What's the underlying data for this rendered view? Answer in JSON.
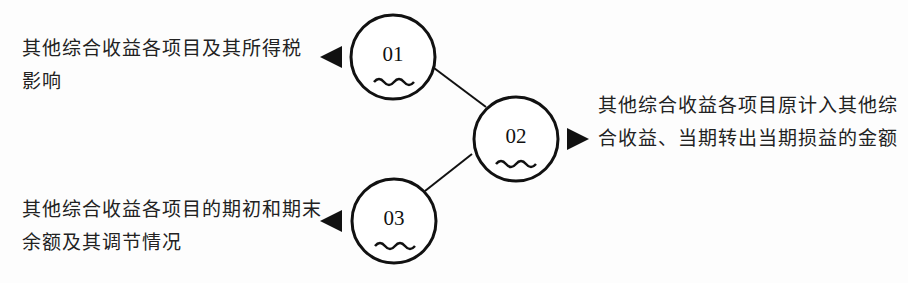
{
  "diagram": {
    "nodes": [
      {
        "id": "01",
        "label": "01",
        "description": "其他综合收益各项目及其所得税影响",
        "arrow": "left"
      },
      {
        "id": "02",
        "label": "02",
        "description": "其他综合收益各项目原计入其他综合收益、当期转出当期损益的金额",
        "arrow": "right"
      },
      {
        "id": "03",
        "label": "03",
        "description": "其他综合收益各项目的期初和期末余额及其调节情况",
        "arrow": "left"
      }
    ],
    "edges": [
      {
        "from": "01",
        "to": "02"
      },
      {
        "from": "02",
        "to": "03"
      }
    ],
    "colors": {
      "stroke": "#111111",
      "background": "#fdfdfd",
      "text": "#222222"
    }
  }
}
